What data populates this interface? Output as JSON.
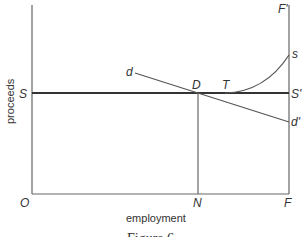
{
  "diagram": {
    "type": "economics-diagram",
    "axes": {
      "y_label": "proceeds",
      "x_label": "employment"
    },
    "points": {
      "origin": "O",
      "S": "S",
      "S_prime": "S'",
      "F": "F",
      "F_prime": "F'",
      "N": "N",
      "D": "D",
      "T": "T",
      "d": "d",
      "d_prime": "d'",
      "s": "s"
    },
    "lines": [
      {
        "name": "supply-price-line",
        "from": "S",
        "to": "S'"
      },
      {
        "name": "demand-line",
        "from": "d",
        "to": "d'"
      },
      {
        "name": "supply-curve",
        "from": "T",
        "to": "s"
      },
      {
        "name": "employment-line",
        "from": "D",
        "to": "N"
      },
      {
        "name": "full-employment-line",
        "from": "F",
        "to": "F'"
      }
    ],
    "caption": "Figure 6"
  }
}
